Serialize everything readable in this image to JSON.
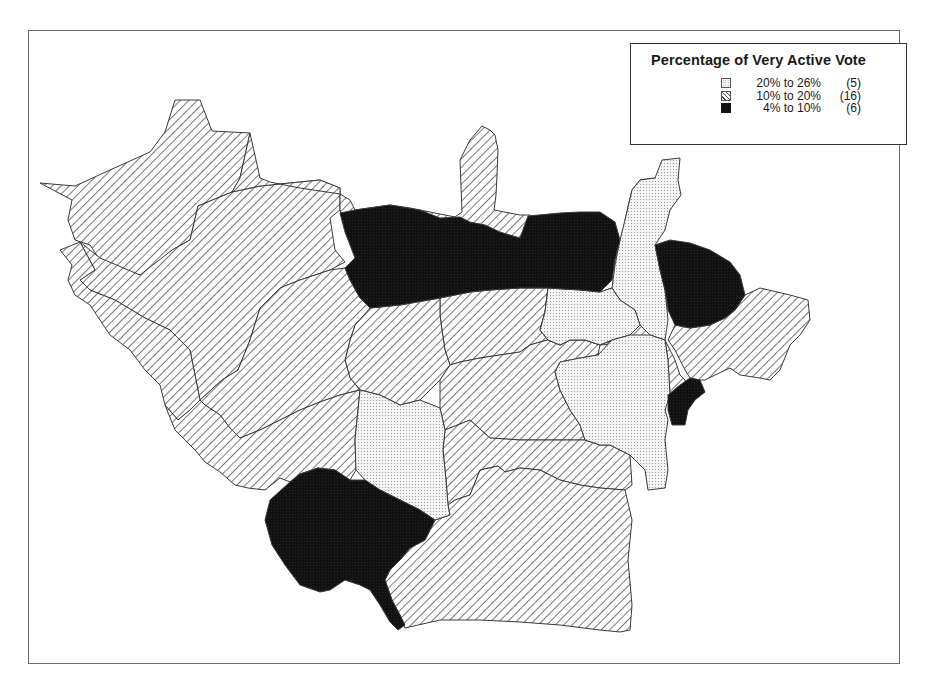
{
  "legend": {
    "title": "Percentage of Very Active Vote",
    "items": [
      {
        "range": "20% to 26%",
        "count": "(5)",
        "pattern": "dots"
      },
      {
        "range": "10% to 20%",
        "count": "(16)",
        "pattern": "hatch"
      },
      {
        "range": "4% to 10%",
        "count": "(6)",
        "pattern": "dark"
      }
    ]
  },
  "colors": {
    "frame": "#6e6e6e",
    "boundary": "#3a3a3a",
    "hatch_line": "#555555",
    "dots_bg": "#f4f4f4",
    "dots_fg": "#8f8f8f",
    "dark": "#111111"
  },
  "map": {
    "regions": [
      {
        "id": "nw-large",
        "class": "hatch",
        "points": "40,183 75,186 110,170 150,152 165,132 175,100 200,100 212,131 250,133 240,178 232,192 198,206 190,240 172,250 160,278 140,275 120,272 100,260 90,245 75,240 68,220 72,200"
      },
      {
        "id": "w-upper",
        "class": "hatch",
        "points": "80,242 100,258 140,275 172,250 190,240 198,206 232,192 260,186 320,180 340,188 340,210 330,218 335,250 345,262 330,270 300,280 280,288 260,308 250,340 238,370 222,380 200,400 190,350 170,330 145,318 115,300 90,290 80,280 95,270"
      },
      {
        "id": "w-lower",
        "class": "hatch",
        "points": "60,250 80,242 95,270 80,280 90,290 115,300 145,318 170,330 190,350 200,400 190,410 178,420 165,405 160,385 145,370 130,350 110,335 100,320 90,305 75,295 68,280 72,265"
      },
      {
        "id": "top-ridge",
        "class": "hatch",
        "points": "250,133 260,178 270,182 300,188 340,194 350,200 355,210 390,205 410,208 430,212 455,217 462,212 460,160 470,140 482,126 490,130 495,135 498,150 497,175 496,195 494,210 520,215 530,215 525,230 520,240 500,240 480,232 455,227 440,232 420,230 395,230 370,240 360,232 345,228 340,210 340,188 320,180 260,186 232,192 240,178"
      },
      {
        "id": "dark-central",
        "class": "dark",
        "points": "340,213 355,210 390,205 420,210 440,218 460,217 470,222 485,225 500,232 520,238 528,216 560,213 580,212 600,212 615,222 620,240 615,260 612,280 600,292 580,290 548,288 520,288 490,290 470,292 440,298 400,305 370,308 360,298 350,280 345,268 355,258 350,245 345,232"
      },
      {
        "id": "dotted-ne-strip",
        "class": "dots",
        "points": "632,190 640,180 655,178 662,160 680,158 678,180 681,195 670,210 665,230 655,245 660,270 665,290 668,320 665,340 650,335 640,325 635,310 620,300 612,288 615,265 620,240 625,220"
      },
      {
        "id": "dark-ne",
        "class": "dark",
        "points": "655,245 670,240 690,243 710,250 730,262 740,275 745,295 735,310 725,318 710,325 690,328 675,325 668,310 665,290 660,270"
      },
      {
        "id": "hatch-nnw-sliver",
        "class": "hatch",
        "points": "625,220 632,190 640,180 655,178 650,210 640,218 630,222"
      },
      {
        "id": "dotted-center-top",
        "class": "dots",
        "points": "548,288 580,290 600,292 612,288 620,300 635,310 640,325 630,335 612,340 600,345 585,340 570,340 560,345 548,340 540,330 545,312"
      },
      {
        "id": "center-hatch-a",
        "class": "hatch",
        "points": "440,298 470,292 490,290 520,288 548,288 545,312 540,330 548,340 540,342 530,345 520,352 500,355 480,358 460,362 450,365 445,350 442,330 440,315"
      },
      {
        "id": "center-hatch-b",
        "class": "hatch",
        "points": "370,308 400,305 440,298 440,315 442,330 445,350 450,365 440,380 430,390 420,400 400,405 380,395 360,390 350,378 345,360 350,340 355,325"
      },
      {
        "id": "center-w-hatch",
        "class": "hatch",
        "points": "238,370 250,340 260,308 280,288 300,280 330,270 345,268 350,280 360,298 370,308 355,325 350,340 345,360 350,378 360,390 340,395 320,402 300,410 280,420 260,430 240,438 230,428 220,415 205,405 200,400 222,380"
      },
      {
        "id": "sw-hatch",
        "class": "hatch",
        "points": "165,405 178,420 190,410 200,400 205,405 220,415 230,428 240,438 260,430 280,420 300,410 320,402 340,395 360,390 358,410 355,440 356,470 350,480 335,470 318,468 300,474 290,482 280,478 265,490 248,488 235,485 220,472 205,462 195,450 185,440 175,430"
      },
      {
        "id": "dotted-center",
        "class": "dots",
        "points": "360,390 380,395 400,405 420,400 440,408 445,430 443,450 446,480 448,505 450,515 435,520 420,510 400,500 380,490 365,480 356,470 355,440 358,410"
      },
      {
        "id": "dark-sw",
        "class": "dark",
        "points": "290,482 300,474 318,468 335,470 350,480 365,480 380,490 400,500 420,510 435,520 430,530 425,540 410,548 400,560 390,570 385,580 392,600 400,615 405,625 398,630 390,622 380,605 370,590 360,585 345,580 330,590 320,592 300,585 285,565 272,545 265,520 270,500"
      },
      {
        "id": "center-east-hatch",
        "class": "hatch",
        "points": "450,365 460,362 480,358 500,355 520,352 530,345 540,342 548,340 560,345 570,340 585,340 600,345 598,355 580,358 560,362 555,372 560,390 570,410 580,425 585,440 550,440 520,440 490,438 470,420 445,430 440,408 440,380"
      },
      {
        "id": "dotted-east",
        "class": "dots",
        "points": "555,372 560,362 580,358 598,355 612,340 630,335 650,335 665,340 668,360 670,395 665,410 668,420 665,440 668,470 665,488 648,490 645,470 630,455 610,445 600,445 585,440 580,425 570,410 560,390"
      },
      {
        "id": "hatch-east-mid",
        "class": "hatch",
        "points": "600,345 612,340 630,335 640,325 650,335 665,340 670,350 675,360 680,375 685,380 688,390 680,395 670,395 668,360 665,340"
      },
      {
        "id": "dark-east-small",
        "class": "dark",
        "points": "668,395 680,385 690,378 700,380 705,392 695,400 688,410 685,425 672,425 668,410"
      },
      {
        "id": "hatch-e-arm",
        "class": "hatch",
        "points": "668,340 675,325 690,328 710,325 725,318 735,310 745,295 760,288 790,295 808,300 810,320 800,335 790,345 780,370 770,380 760,378 740,375 730,368 715,375 705,380 700,380 690,378 685,370 680,360 675,350"
      },
      {
        "id": "hatch-ne-center",
        "class": "hatch",
        "points": "600,292 612,288 620,300 612,340 600,345 585,340 570,340 560,345 548,340 540,330 545,312 548,288 580,290"
      },
      {
        "id": "se-hatch-upper",
        "class": "hatch",
        "points": "445,430 470,420 490,438 520,440 550,440 585,440 600,445 610,445 630,455 632,485 625,490 600,488 580,485 560,480 540,470 520,468 505,472 498,466 480,470 470,495 455,500 448,505 446,480 443,450"
      },
      {
        "id": "se-hatch-lower",
        "class": "hatch",
        "points": "448,505 455,500 470,495 480,470 498,466 505,472 520,468 540,470 560,480 580,485 600,488 625,490 632,520 628,560 632,605 630,630 620,632 600,630 560,625 520,622 480,620 440,620 405,628 400,615 392,600 385,580 390,570 400,560 410,548 425,540 430,530 435,520 450,515"
      }
    ]
  }
}
